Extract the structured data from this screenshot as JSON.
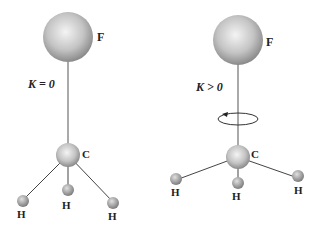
{
  "left_molecule": {
    "k_label": "K = 0",
    "atoms": {
      "top": "F",
      "center": "C",
      "h1": "H",
      "h2": "H",
      "h3": "H"
    }
  },
  "right_molecule": {
    "k_label": "K > 0",
    "atoms": {
      "top": "F",
      "center": "C",
      "h1": "H",
      "h2": "H",
      "h3": "H"
    },
    "rotation_indicator": "rotation-arrow"
  }
}
